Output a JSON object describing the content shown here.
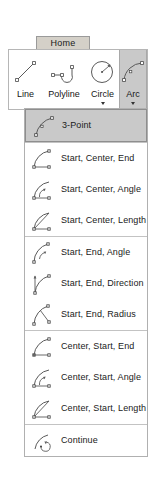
{
  "ribbon": {
    "tab": {
      "label": "Home",
      "icon": "home-tab"
    },
    "buttons": [
      {
        "label": "Line",
        "icon": "line-icon",
        "has_caret": false,
        "active": false,
        "width": 33
      },
      {
        "label": "Polyline",
        "icon": "polyline-icon",
        "has_caret": false,
        "active": false,
        "width": 44
      },
      {
        "label": "Circle",
        "icon": "circle-icon",
        "has_caret": true,
        "active": false,
        "width": 33
      },
      {
        "label": "Arc",
        "icon": "arc-icon",
        "has_caret": true,
        "active": true,
        "width": 28
      }
    ]
  },
  "arc_menu": {
    "groups": [
      {
        "items": [
          {
            "label": "3-Point",
            "icon": "arc-3-point-icon",
            "selected": true
          }
        ]
      },
      {
        "items": [
          {
            "label": "Start, Center, End",
            "icon": "arc-start-center-end-icon",
            "selected": false
          },
          {
            "label": "Start, Center, Angle",
            "icon": "arc-start-center-angle-icon",
            "selected": false
          },
          {
            "label": "Start, Center, Length",
            "icon": "arc-start-center-length-icon",
            "selected": false
          }
        ]
      },
      {
        "items": [
          {
            "label": "Start, End, Angle",
            "icon": "arc-start-end-angle-icon",
            "selected": false
          },
          {
            "label": "Start, End, Direction",
            "icon": "arc-start-end-direction-icon",
            "selected": false
          },
          {
            "label": "Start, End, Radius",
            "icon": "arc-start-end-radius-icon",
            "selected": false
          }
        ]
      },
      {
        "items": [
          {
            "label": "Center, Start, End",
            "icon": "arc-center-start-end-icon",
            "selected": false
          },
          {
            "label": "Center, Start, Angle",
            "icon": "arc-center-start-angle-icon",
            "selected": false
          },
          {
            "label": "Center, Start, Length",
            "icon": "arc-center-start-length-icon",
            "selected": false
          }
        ]
      },
      {
        "items": [
          {
            "label": "Continue",
            "icon": "arc-continue-icon",
            "selected": false
          }
        ]
      }
    ]
  },
  "colors": {
    "tab_background": "#d4d0c8",
    "active_button_background": "#c9c9c9",
    "selected_item_background": "#c9c9c9",
    "panel_background": "#ffffff",
    "border": "#b0b0b0",
    "stroke": "#5a5a5a",
    "text": "#1a1a1a"
  }
}
